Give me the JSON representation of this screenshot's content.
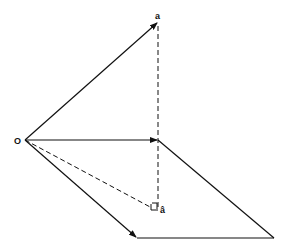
{
  "diagram": {
    "labels": {
      "origin": "O",
      "vector_a": "a",
      "projection": "â"
    },
    "colors": {
      "stroke": "#111111",
      "background": "#ffffff"
    },
    "points": {
      "O": [
        25,
        140
      ],
      "a": [
        158,
        22
      ],
      "plane_point": [
        158,
        140
      ],
      "a_hat": [
        158,
        211
      ],
      "bottom_left": [
        137,
        238
      ],
      "bottom_right": [
        274,
        238
      ]
    }
  }
}
